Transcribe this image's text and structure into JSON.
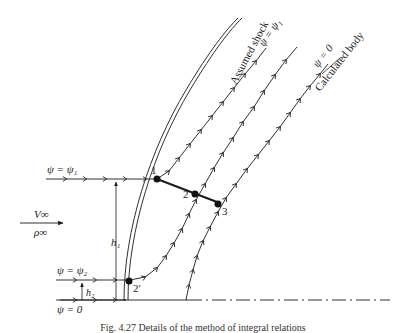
{
  "labels": {
    "shock": "Assumed shock",
    "body": "Calculated body",
    "psi_upper_top": "ψ = ψ₁",
    "psi_body_top": "ψ = 0",
    "psi1": "ψ = ψ₁",
    "psi2": "ψ = ψ₂",
    "psi0": "ψ = 0",
    "v_inf": "V∞",
    "rho_inf": "ρ∞",
    "h1": "h₁",
    "h2": "h₂",
    "point1": "1",
    "point2": "2",
    "point3": "3",
    "point2prime": "2′"
  },
  "caption": "Fig. 4.27  Details of the method of integral relations"
}
